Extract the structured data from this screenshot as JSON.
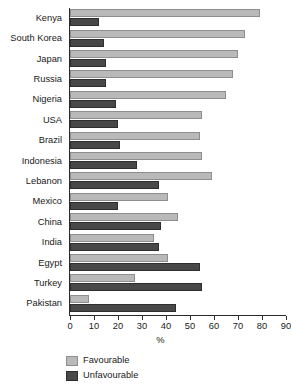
{
  "chart_data": {
    "type": "bar",
    "orientation": "horizontal",
    "title": "",
    "xlabel": "%",
    "ylabel": "",
    "xlim": [
      0,
      90
    ],
    "xticks": [
      0,
      10,
      20,
      30,
      40,
      50,
      60,
      70,
      80,
      90
    ],
    "grid": false,
    "legend_position": "bottom-left",
    "categories": [
      "Kenya",
      "South Korea",
      "Japan",
      "Russia",
      "Nigeria",
      "USA",
      "Brazil",
      "Indonesia",
      "Lebanon",
      "Mexico",
      "China",
      "India",
      "Egypt",
      "Turkey",
      "Pakistan"
    ],
    "series": [
      {
        "name": "Favourable",
        "color": "#b9b9b9",
        "values": [
          79,
          73,
          70,
          68,
          65,
          55,
          54,
          55,
          59,
          41,
          45,
          35,
          41,
          27,
          8
        ]
      },
      {
        "name": "Unfavourable",
        "color": "#484848",
        "values": [
          12,
          14,
          15,
          15,
          19,
          20,
          21,
          28,
          37,
          20,
          38,
          37,
          54,
          55,
          44
        ]
      }
    ]
  },
  "legend": {
    "items": [
      {
        "label": "Favourable",
        "swatch": "fav"
      },
      {
        "label": "Unfavourable",
        "swatch": "unfav"
      }
    ]
  },
  "axis": {
    "x_title": "%"
  }
}
